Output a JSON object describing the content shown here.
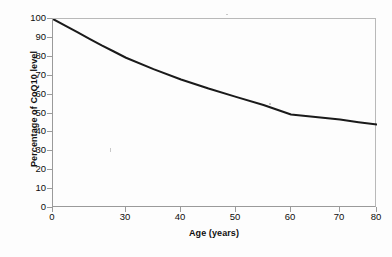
{
  "chart_data": {
    "type": "line",
    "title": "",
    "xlabel": "Age (years)",
    "ylabel": "Percentage of CoQ10 level",
    "xlim": [
      0,
      80
    ],
    "ylim": [
      0,
      100
    ],
    "grid": false,
    "legend": null,
    "x_ticks": [
      {
        "value": 0,
        "label": "0"
      },
      {
        "value": 30,
        "label": "30"
      },
      {
        "value": 40,
        "label": "40"
      },
      {
        "value": 50,
        "label": "50"
      },
      {
        "value": 60,
        "label": "60"
      },
      {
        "value": 70,
        "label": "70"
      },
      {
        "value": 80,
        "label": "80"
      }
    ],
    "y_ticks": [
      {
        "value": 100,
        "label": "100"
      },
      {
        "value": 90,
        "label": "90"
      },
      {
        "value": 80,
        "label": "80"
      },
      {
        "value": 70,
        "label": "70"
      },
      {
        "value": 60,
        "label": "60"
      },
      {
        "value": 50,
        "label": "50"
      },
      {
        "value": 40,
        "label": "40"
      },
      {
        "value": 30,
        "label": "30"
      },
      {
        "value": 20,
        "label": "20"
      },
      {
        "value": 10,
        "label": "10"
      },
      {
        "value": 0,
        "label": "0"
      }
    ],
    "series": [
      {
        "name": "CoQ10 level",
        "color": "#1a1a1a",
        "line_width": 2,
        "x": [
          0,
          5,
          10,
          15,
          20,
          25,
          30,
          35,
          40,
          45,
          50,
          55,
          60,
          65,
          70,
          75,
          80
        ],
        "y": [
          100,
          96.5,
          93,
          89.5,
          86,
          82.8,
          79.5,
          73.5,
          68,
          63.2,
          58.8,
          54.5,
          49.5,
          48.2,
          46.8,
          45.4,
          44.2
        ]
      }
    ]
  }
}
